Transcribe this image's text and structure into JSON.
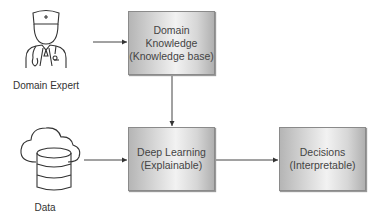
{
  "nodes": {
    "domain_expert": {
      "label": "Domain Expert",
      "icon": "doctor-icon"
    },
    "data": {
      "label": "Data",
      "icon": "cloud-database-icon"
    },
    "domain_knowledge": {
      "line1": "Domain",
      "line2": "Knowledge",
      "line3": "(Knowledge base)"
    },
    "deep_learning": {
      "line1": "Deep Learning",
      "line2": "(Explainable)"
    },
    "decisions": {
      "line1": "Decisions",
      "line2": "(Interpretable)"
    }
  },
  "edges": [
    {
      "from": "domain_expert",
      "to": "domain_knowledge"
    },
    {
      "from": "domain_knowledge",
      "to": "deep_learning"
    },
    {
      "from": "data",
      "to": "deep_learning"
    },
    {
      "from": "deep_learning",
      "to": "decisions"
    }
  ]
}
